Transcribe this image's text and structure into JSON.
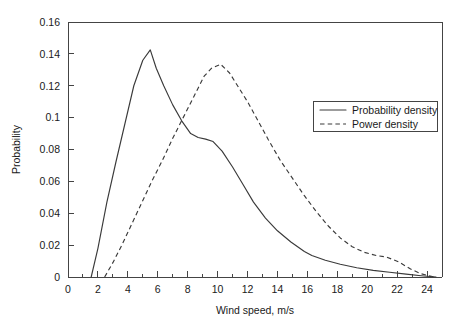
{
  "chart_data": {
    "type": "line",
    "title": "",
    "xlabel": "Wind speed, m/s",
    "ylabel": "Probability",
    "xlim": [
      0,
      25
    ],
    "ylim": [
      0,
      0.16
    ],
    "xticks": [
      0,
      2,
      4,
      6,
      8,
      10,
      12,
      14,
      16,
      18,
      20,
      22,
      24
    ],
    "xtick_labels": [
      "0",
      "2",
      "4",
      "6",
      "8",
      "10",
      "12",
      "14",
      "16",
      "18",
      "20",
      "22",
      "24"
    ],
    "x_minor_step": 1,
    "yticks": [
      0,
      0.02,
      0.04,
      0.06,
      0.08,
      0.1,
      0.12,
      0.14,
      0.16
    ],
    "ytick_labels": [
      "0",
      "0.02",
      "0.04",
      "0.06",
      "0.08",
      "0.1",
      "0.12",
      "0.14",
      "0.16"
    ],
    "grid": false,
    "legend_position": "upper right",
    "series": [
      {
        "name": "Probability density",
        "style": "solid",
        "color": "#3a3a3a",
        "x": [
          1.55,
          2.0,
          2.6,
          3.2,
          3.8,
          4.4,
          5.0,
          5.5,
          5.9,
          6.4,
          7.0,
          7.6,
          8.2,
          8.7,
          9.2,
          9.7,
          10.3,
          11.0,
          11.7,
          12.4,
          13.2,
          14.0,
          14.9,
          15.8,
          16.3,
          17.2,
          18.2,
          19.3,
          20.4,
          21.5,
          22.6,
          23.6,
          24.6
        ],
        "y": [
          0.0,
          0.018,
          0.047,
          0.072,
          0.096,
          0.12,
          0.136,
          0.1425,
          0.131,
          0.12,
          0.108,
          0.098,
          0.09,
          0.0875,
          0.0865,
          0.085,
          0.079,
          0.069,
          0.058,
          0.047,
          0.037,
          0.029,
          0.022,
          0.016,
          0.0135,
          0.0105,
          0.008,
          0.0058,
          0.0042,
          0.003,
          0.0018,
          0.0008,
          0.0
        ]
      },
      {
        "name": "Power density",
        "style": "dashed",
        "color": "#3a3a3a",
        "x": [
          2.45,
          3.0,
          3.6,
          4.2,
          4.9,
          5.6,
          6.3,
          7.0,
          7.7,
          8.4,
          9.1,
          9.6,
          10.2,
          10.8,
          11.4,
          12.0,
          12.7,
          13.4,
          14.2,
          15.0,
          15.8,
          16.6,
          17.4,
          18.2,
          19.0,
          19.8,
          20.6,
          21.3,
          22.1,
          22.9,
          23.6,
          24.5
        ],
        "y": [
          0.0,
          0.009,
          0.02,
          0.032,
          0.046,
          0.06,
          0.073,
          0.087,
          0.1,
          0.113,
          0.126,
          0.131,
          0.1335,
          0.128,
          0.119,
          0.11,
          0.098,
          0.086,
          0.073,
          0.062,
          0.051,
          0.041,
          0.032,
          0.0245,
          0.019,
          0.0155,
          0.0135,
          0.0125,
          0.0095,
          0.005,
          0.002,
          0.0
        ]
      }
    ]
  },
  "legend": {
    "entries": [
      {
        "label": "Probability density",
        "style": "solid"
      },
      {
        "label": "Power density",
        "style": "dashed"
      }
    ]
  },
  "axes": {
    "x_title": "Wind speed, m/s",
    "y_title": "Probability"
  }
}
